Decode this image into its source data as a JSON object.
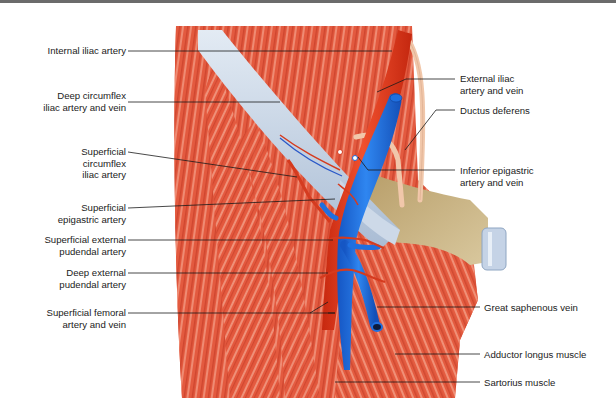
{
  "figure": {
    "colors": {
      "muscle": "#e0553a",
      "muscle_light": "#f29a80",
      "muscle_dark": "#b8321f",
      "artery": "#e83a1e",
      "vein": "#1f6fe0",
      "ligament": "#c9d6e6",
      "fascia_tan": "#cbb58a",
      "ductus": "#f2cbb0",
      "leader_line": "#1a1a1a"
    }
  },
  "labels_left": [
    {
      "id": "internal-iliac-artery",
      "text": "Internal iliac artery"
    },
    {
      "id": "deep-circumflex-iliac",
      "text": "Deep circumflex\niliac artery and vein"
    },
    {
      "id": "superficial-circumflex-iliac",
      "text": "Superficial\ncircumflex\niliac artery"
    },
    {
      "id": "superficial-epigastric",
      "text": "Superficial\nepigastric artery"
    },
    {
      "id": "superficial-external-pudendal",
      "text": "Superficial external\npudendal artery"
    },
    {
      "id": "deep-external-pudendal",
      "text": "Deep external\npudendal artery"
    },
    {
      "id": "superficial-femoral",
      "text": "Superficial femoral\nartery and vein"
    }
  ],
  "labels_right": [
    {
      "id": "external-iliac",
      "text": "External iliac\nartery and vein"
    },
    {
      "id": "ductus-deferens",
      "text": "Ductus deferens"
    },
    {
      "id": "inferior-epigastric",
      "text": "Inferior epigastric\nartery and vein"
    },
    {
      "id": "great-saphenous-vein",
      "text": "Great saphenous vein"
    },
    {
      "id": "adductor-longus",
      "text": "Adductor longus muscle"
    },
    {
      "id": "sartorius",
      "text": "Sartorius muscle"
    }
  ]
}
